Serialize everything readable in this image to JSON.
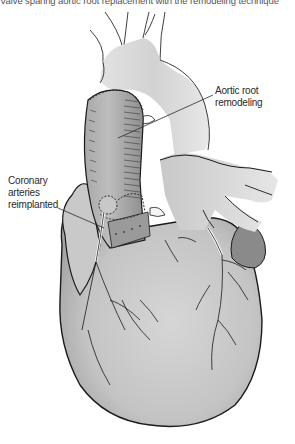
{
  "figure": {
    "top_caption_fragment": "Valve sparing aortic root replacement with the remodeling technique",
    "labels": [
      {
        "id": "aortic-root",
        "lines": [
          "Aortic root",
          "remodeling"
        ]
      },
      {
        "id": "coronary-arteries",
        "lines": [
          "Coronary",
          "arteries",
          "reimplanted"
        ]
      }
    ],
    "colors": {
      "background": "#ffffff",
      "tissue_light": "#d4d4d4",
      "tissue_mid": "#b8b8b8",
      "tissue_dark": "#8a8a8a",
      "outline": "#1a1a1a",
      "label_text": "#2a2a2a"
    }
  }
}
